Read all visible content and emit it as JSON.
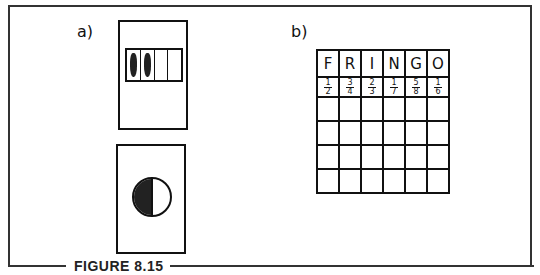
{
  "figure": {
    "caption": "FIGURE 8.15"
  },
  "panel_a": {
    "label": "a)",
    "strip_card": {
      "segments": 4,
      "filled_segments": 2
    },
    "circle_card": {
      "fraction_shaded": "1/2"
    }
  },
  "panel_b": {
    "label": "b)",
    "header": [
      "F",
      "R",
      "I",
      "N",
      "G",
      "O"
    ],
    "fractions": [
      {
        "n": "1",
        "d": "2"
      },
      {
        "n": "3",
        "d": "4"
      },
      {
        "n": "2",
        "d": "3"
      },
      {
        "n": "1",
        "d": "7"
      },
      {
        "n": "5",
        "d": "8"
      },
      {
        "n": "1",
        "d": "6"
      }
    ],
    "empty_rows": 4
  }
}
